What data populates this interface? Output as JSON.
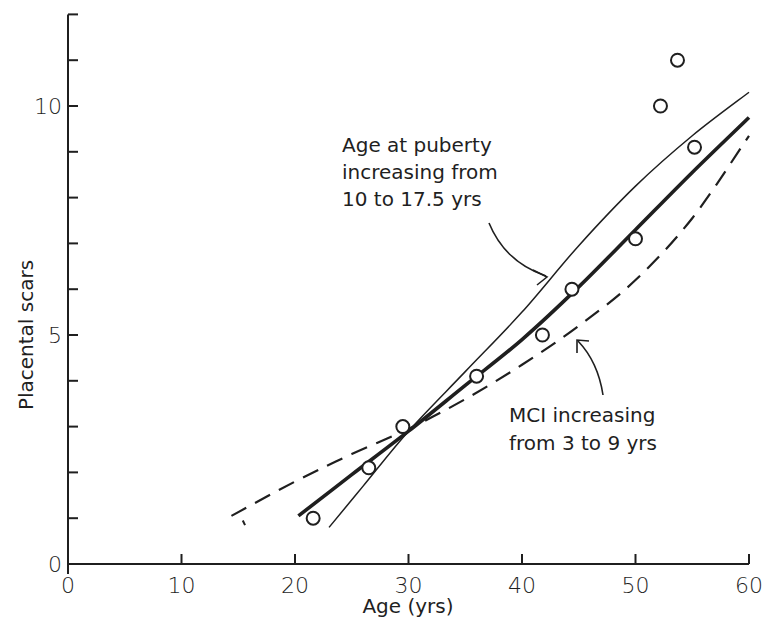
{
  "chart_data": {
    "type": "line",
    "title": "",
    "xlabel": "Age (yrs)",
    "ylabel": "Placental scars",
    "xlim": [
      0,
      60
    ],
    "ylim": [
      0,
      12
    ],
    "grid": false,
    "x_ticks": [
      0,
      10,
      20,
      30,
      40,
      50,
      60
    ],
    "x_tick_labels": [
      "0",
      "10",
      "20",
      "30",
      "40",
      "50",
      "60"
    ],
    "y_ticks_labeled": [
      0,
      5,
      10
    ],
    "y_tick_labels": [
      "0",
      "5",
      "10"
    ],
    "y_minor_ticks": [
      1,
      2,
      3,
      4,
      6,
      7,
      8,
      9,
      11,
      12
    ],
    "series": [
      {
        "name": "Observed",
        "style": "open-circle-markers",
        "points": [
          {
            "x": 21.6,
            "y": 1.0
          },
          {
            "x": 26.5,
            "y": 2.1
          },
          {
            "x": 29.5,
            "y": 3.0
          },
          {
            "x": 36.0,
            "y": 4.1
          },
          {
            "x": 41.8,
            "y": 5.0
          },
          {
            "x": 44.4,
            "y": 6.0
          },
          {
            "x": 50.0,
            "y": 7.1
          },
          {
            "x": 52.2,
            "y": 10.0
          },
          {
            "x": 53.7,
            "y": 11.0
          },
          {
            "x": 55.2,
            "y": 9.1
          }
        ]
      },
      {
        "name": "Fitted model",
        "style": "thick-solid",
        "points": [
          {
            "x": 20.3,
            "y": 1.05
          },
          {
            "x": 25,
            "y": 1.95
          },
          {
            "x": 30,
            "y": 2.9
          },
          {
            "x": 35,
            "y": 3.9
          },
          {
            "x": 40,
            "y": 4.9
          },
          {
            "x": 45,
            "y": 6.05
          },
          {
            "x": 50,
            "y": 7.3
          },
          {
            "x": 55,
            "y": 8.55
          },
          {
            "x": 60,
            "y": 9.75
          }
        ]
      },
      {
        "name": "Age at puberty increasing from 10 to 17.5 yrs",
        "style": "thin-solid",
        "points": [
          {
            "x": 23,
            "y": 0.8
          },
          {
            "x": 26,
            "y": 1.7
          },
          {
            "x": 30,
            "y": 2.9
          },
          {
            "x": 35,
            "y": 4.2
          },
          {
            "x": 40,
            "y": 5.5
          },
          {
            "x": 45,
            "y": 6.95
          },
          {
            "x": 50,
            "y": 8.25
          },
          {
            "x": 55,
            "y": 9.35
          },
          {
            "x": 60,
            "y": 10.3
          }
        ]
      },
      {
        "name": "MCI increasing from 3 to 9 yrs",
        "style": "dashed",
        "points": [
          {
            "x": 14.4,
            "y": 1.05
          },
          {
            "x": 20,
            "y": 1.8
          },
          {
            "x": 25,
            "y": 2.4
          },
          {
            "x": 30,
            "y": 2.95
          },
          {
            "x": 35,
            "y": 3.6
          },
          {
            "x": 40,
            "y": 4.35
          },
          {
            "x": 45,
            "y": 5.2
          },
          {
            "x": 50,
            "y": 6.2
          },
          {
            "x": 55,
            "y": 7.55
          },
          {
            "x": 60,
            "y": 9.35
          }
        ]
      }
    ],
    "annotations": [
      {
        "lines": [
          "Age at puberty",
          "increasing from",
          "10 to 17.5 yrs"
        ],
        "points_to": "thin-solid curve near x≈41"
      },
      {
        "lines": [
          "MCI increasing",
          "from 3 to 9 yrs"
        ],
        "points_to": "dashed curve near x≈43"
      }
    ]
  },
  "labels": {
    "xlabel": "Age (yrs)",
    "ylabel": "Placental scars",
    "annotation_puberty": [
      "Age at puberty",
      "increasing from",
      "10 to 17.5 yrs"
    ],
    "annotation_mci": [
      "MCI increasing",
      "from 3 to 9 yrs"
    ]
  },
  "style": {
    "ink": "#1f1f1f",
    "background": "#ffffff"
  }
}
